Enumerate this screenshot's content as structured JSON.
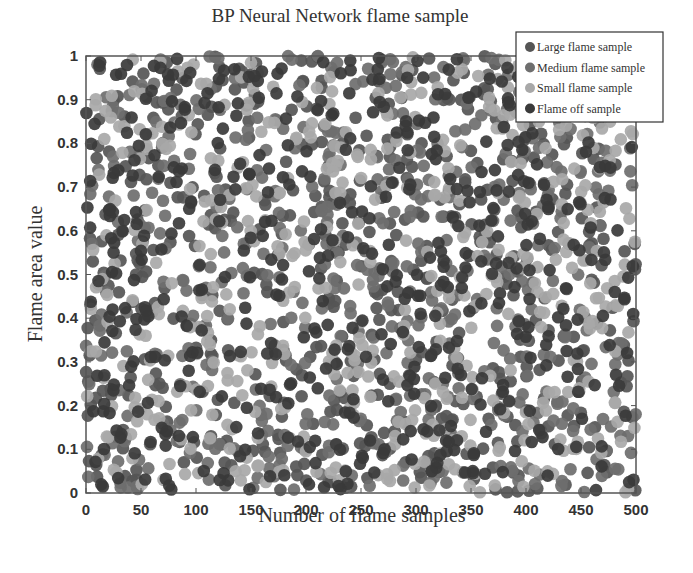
{
  "chart_data": {
    "type": "scatter",
    "title": "BP Neural Network flame sample",
    "xlabel": "Number of flame samples",
    "ylabel": "Flame area value",
    "xlim": [
      0,
      500
    ],
    "ylim": [
      0,
      1
    ],
    "xticks": [
      "0",
      "50",
      "100",
      "150",
      "200",
      "250",
      "300",
      "350",
      "400",
      "450",
      "500"
    ],
    "yticks": [
      "0",
      "0.1",
      "0.2",
      "0.3",
      "0.4",
      "0.5",
      "0.6",
      "0.7",
      "0.8",
      "0.9",
      "1"
    ],
    "grid": false,
    "legend_position": "upper right (outside top edge)",
    "points_per_series_approx": 500,
    "distribution": "uniform random, x in [0,500], y in [0,1]",
    "series": [
      {
        "name": "Large flame sample",
        "color": "#555555",
        "seed": 11
      },
      {
        "name": "Medium flame sample",
        "color": "#6e6e6e",
        "seed": 23
      },
      {
        "name": "Small flame sample",
        "color": "#a8a8a8",
        "seed": 37
      },
      {
        "name": "Flame off sample",
        "color": "#3a3a3a",
        "seed": 53
      }
    ]
  },
  "legend": {
    "items": [
      {
        "label": "Large flame sample",
        "color": "#555555"
      },
      {
        "label": "Medium flame sample",
        "color": "#6e6e6e"
      },
      {
        "label": "Small flame sample",
        "color": "#a8a8a8"
      },
      {
        "label": "Flame off sample",
        "color": "#3a3a3a"
      }
    ]
  }
}
